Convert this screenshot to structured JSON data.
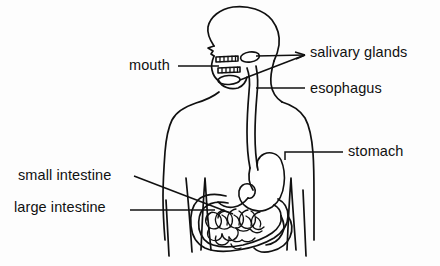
{
  "diagram": {
    "background_color": "#fdfdfd",
    "line_color": "#101010",
    "labels": {
      "mouth": "mouth",
      "salivary_glands": "salivary glands",
      "esophagus": "esophagus",
      "stomach": "stomach",
      "small_intestine": "small intestine",
      "large_intestine": "large intestine"
    },
    "parts": [
      "head-profile",
      "upper-teeth",
      "lower-teeth",
      "tongue",
      "salivary-gland-upper",
      "salivary-gland-lower",
      "esophagus-tube",
      "stomach-organ",
      "small-intestine-coils",
      "large-intestine-frame",
      "torso-outline",
      "left-arm",
      "right-arm",
      "hip-lines"
    ]
  }
}
